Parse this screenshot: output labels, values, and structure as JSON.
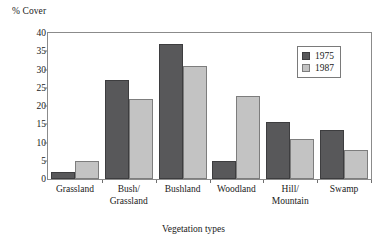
{
  "chart_data": {
    "type": "bar",
    "title": "",
    "subtitle": "",
    "xlabel": "Vegetation types",
    "ylabel": "% Cover",
    "ylim": [
      0,
      40
    ],
    "yticks": [
      0,
      5,
      10,
      15,
      20,
      25,
      30,
      35,
      40
    ],
    "ytick_labels": [
      "0",
      "5",
      "10",
      "15",
      "20",
      "25",
      "30",
      "35",
      "40"
    ],
    "grid": false,
    "legend_position": "top-right",
    "categories": [
      "Grassland",
      "Bush/\nGrassland",
      "Bushland",
      "Woodland",
      "Hill/\nMountain",
      "Swamp"
    ],
    "series": [
      {
        "name": "1975",
        "color": "#58585a",
        "values": [
          2,
          27,
          37,
          5,
          15.5,
          13.3
        ]
      },
      {
        "name": "1987",
        "color": "#c3c3c3",
        "values": [
          5,
          22,
          31,
          22.8,
          11,
          8
        ]
      }
    ]
  },
  "legend": {
    "entries": [
      {
        "label": "1975",
        "swatch": "dark-swatch-icon"
      },
      {
        "label": "1987",
        "swatch": "light-swatch-icon"
      }
    ]
  },
  "colors": {
    "series_1975": "#58585a",
    "series_1987": "#c3c3c3",
    "axis": "#8b8b8b",
    "text": "#1a1a1a",
    "background": "#ffffff"
  }
}
